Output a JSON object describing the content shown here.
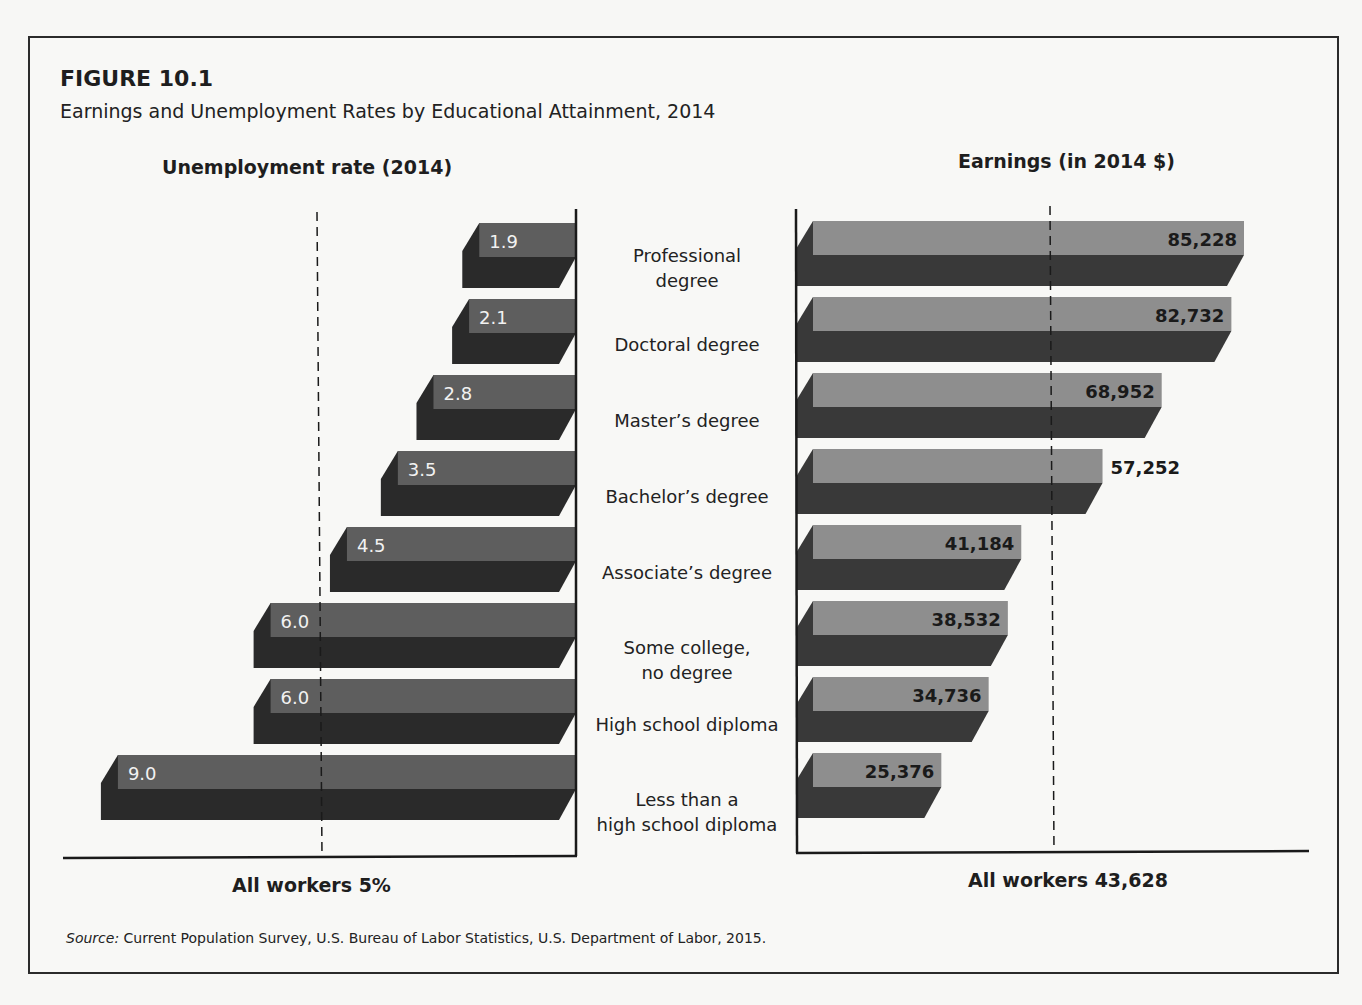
{
  "figure": {
    "number": "FIGURE 10.1",
    "title": "Earnings and Unemployment Rates by Educational Attainment, 2014",
    "source_label": "Source:",
    "source_text": " Current Population Survey, U.S. Bureau of Labor Statistics, U.S. Department of Labor, 2015."
  },
  "left_panel": {
    "title": "Unemployment rate (2014)",
    "footer": "All workers 5%"
  },
  "right_panel": {
    "title": "Earnings (in 2014 $)",
    "footer": "All workers 43,628"
  },
  "categories": [
    {
      "line1": "Professional",
      "line2": "degree"
    },
    {
      "line1": "Doctoral degree",
      "line2": ""
    },
    {
      "line1": "Master’s degree",
      "line2": ""
    },
    {
      "line1": "Bachelor’s degree",
      "line2": ""
    },
    {
      "line1": "Associate’s degree",
      "line2": ""
    },
    {
      "line1": "Some college,",
      "line2": "no degree"
    },
    {
      "line1": "High school diploma",
      "line2": ""
    },
    {
      "line1": "Less than a",
      "line2": "high school diploma"
    }
  ],
  "colors": {
    "left_top_face": "#5e5e5e",
    "left_front_face": "#2a2a2a",
    "right_top_face": "#8e8e8e",
    "right_front_face": "#393939",
    "axis": "#1a1a1a",
    "left_label_text": "#f2f2f2",
    "right_label_text": "#1a1a1a"
  },
  "chart_data": [
    {
      "type": "bar",
      "orientation": "horizontal",
      "title": "Unemployment rate (2014)",
      "categories": [
        "Professional degree",
        "Doctoral degree",
        "Master’s degree",
        "Bachelor’s degree",
        "Associate’s degree",
        "Some college, no degree",
        "High school diploma",
        "Less than a high school diploma"
      ],
      "values": [
        1.9,
        2.1,
        2.8,
        3.5,
        4.5,
        6.0,
        6.0,
        9.0
      ],
      "value_labels": [
        "1.9",
        "2.1",
        "2.8",
        "3.5",
        "4.5",
        "6.0",
        "6.0",
        "9.0"
      ],
      "unit": "%",
      "direction": "right-to-left",
      "reference_line": {
        "value": 5,
        "label": "All workers 5%",
        "style": "dashed"
      },
      "xlabel": "All workers 5%",
      "grid": false
    },
    {
      "type": "bar",
      "orientation": "horizontal",
      "title": "Earnings (in 2014 $)",
      "categories": [
        "Professional degree",
        "Doctoral degree",
        "Master’s degree",
        "Bachelor’s degree",
        "Associate’s degree",
        "Some college, no degree",
        "High school diploma",
        "Less than a high school diploma"
      ],
      "values": [
        85228,
        82732,
        68952,
        57252,
        41184,
        38532,
        34736,
        25376
      ],
      "value_labels": [
        "85,228",
        "82,732",
        "68,952",
        "57,252",
        "41,184",
        "38,532",
        "34,736",
        "25,376"
      ],
      "unit": "2014 $",
      "direction": "left-to-right",
      "reference_line": {
        "value": 43628,
        "label": "All workers 43,628",
        "style": "dashed"
      },
      "xlabel": "All workers 43,628",
      "grid": false
    }
  ]
}
